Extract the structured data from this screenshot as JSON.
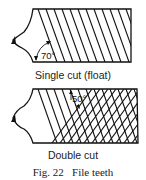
{
  "figure": {
    "number_label": "Fig. 22",
    "title": "File teeth",
    "panels": [
      {
        "name": "single-cut",
        "caption": "Single cut (float)",
        "angle_label": "70°"
      },
      {
        "name": "double-cut",
        "caption": "Double cut",
        "angle_label": "50°"
      }
    ]
  },
  "colors": {
    "line": "#111111",
    "background": "#ffffff"
  }
}
